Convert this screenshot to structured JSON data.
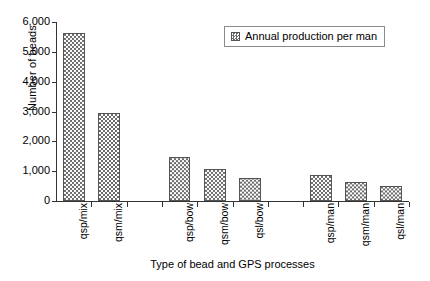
{
  "chart_data": {
    "type": "bar",
    "title": "",
    "xlabel": "Type of bead and GPS processes",
    "ylabel": "Number of beads",
    "ylim": [
      0,
      6000
    ],
    "ytick_labels": [
      "6,000",
      "5,000",
      "4,000",
      "3,000",
      "2,000",
      "1,000",
      "0"
    ],
    "ytick_values": [
      6000,
      5000,
      4000,
      3000,
      2000,
      1000,
      0
    ],
    "grid": false,
    "legend_position": "top-right",
    "legend": [
      "Annual production per man"
    ],
    "categories": [
      "qsp/mix",
      "qsm/mix",
      "",
      "qsp/bow",
      "qsm/bow",
      "qsl/bow",
      "",
      "qsp/man",
      "qsm/man",
      "qsl/man"
    ],
    "values": [
      5630,
      2950,
      null,
      1480,
      1070,
      760,
      null,
      870,
      650,
      520
    ],
    "series": [
      {
        "name": "Annual production per man",
        "values": [
          5630,
          2950,
          null,
          1480,
          1070,
          760,
          null,
          870,
          650,
          520
        ]
      }
    ]
  },
  "axes": {
    "y_title": "Number of beads",
    "x_title": "Type of bead and GPS processes"
  },
  "legend": {
    "swatch_name": "checkered-pattern-swatch",
    "label": "Annual production per man"
  }
}
